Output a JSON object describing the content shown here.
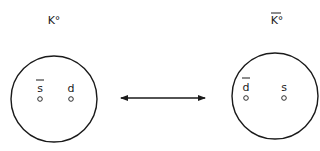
{
  "diagram": {
    "left": {
      "label": "K°",
      "overbar": false,
      "quarks": [
        {
          "symbol": "s",
          "antiparticle": true
        },
        {
          "symbol": "d",
          "antiparticle": false
        }
      ]
    },
    "right": {
      "label": "K°",
      "overbar": true,
      "quarks": [
        {
          "symbol": "d",
          "antiparticle": true
        },
        {
          "symbol": "s",
          "antiparticle": false
        }
      ]
    },
    "connector": "double-headed-arrow"
  }
}
